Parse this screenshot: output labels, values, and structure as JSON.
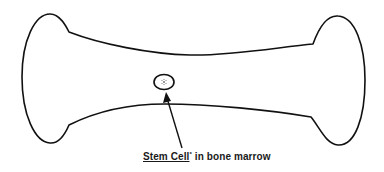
{
  "diagram": {
    "label": {
      "underlined_term": "Stem Cell",
      "footnote_mark": "*",
      "rest": " in bone marrow"
    },
    "elements": [
      {
        "name": "bone-outline",
        "shape": "long bone with two rounded epiphyses"
      },
      {
        "name": "stem-cell",
        "shape": "small ellipse with dotted center"
      },
      {
        "name": "pointer-arrow",
        "shape": "arrow from label to stem cell"
      }
    ],
    "colors": {
      "stroke": "#111111",
      "background": "#ffffff"
    }
  }
}
